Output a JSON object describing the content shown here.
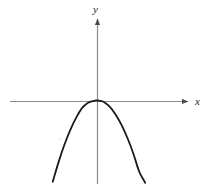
{
  "figure": {
    "kind": "coordinate-plane-parabola",
    "background_color": "#ffffff",
    "width": 211,
    "height": 190
  },
  "axes": {
    "x_label": "x",
    "y_label": "y",
    "axis_color": "#8a8a8a",
    "arrow_color": "#4a4a4a",
    "origin": {
      "x": 97,
      "y": 101
    },
    "x_axis": {
      "start_x": 10,
      "end_x": 190,
      "y": 101,
      "arrow": "right"
    },
    "y_axis": {
      "x": 97,
      "start_y": 17,
      "end_y": 184,
      "arrow": "up"
    },
    "ticks_shown": false,
    "tick_labels": [],
    "gridlines": false
  },
  "chart_data": {
    "type": "line",
    "title": "",
    "subtitle": "",
    "xlabel": "x",
    "ylabel": "y",
    "legend": [],
    "legend_position": "none",
    "grid": false,
    "xlim": [
      -5.8,
      6.2
    ],
    "ylim": [
      -5.6,
      5.6
    ],
    "annotations": [],
    "series": [
      {
        "name": "parabola",
        "curve_color": "#1a1a1a",
        "stroke_width": 1.8,
        "equation_form": "upward parabola tangent to the x-axis at its vertex",
        "vertex": {
          "x": 0.05,
          "y": 0.0
        },
        "opens": "up",
        "x": [
          -3.0,
          -2.6,
          -2.2,
          -1.8,
          -1.4,
          -1.0,
          -0.6,
          -0.2,
          0.05,
          0.4,
          0.8,
          1.2,
          1.6,
          2.0,
          2.4,
          2.8,
          3.2
        ],
        "y": [
          5.45,
          4.1,
          2.92,
          1.92,
          1.1,
          0.46,
          0.13,
          0.01,
          0.0,
          0.08,
          0.4,
          0.92,
          1.62,
          2.5,
          3.55,
          4.78,
          5.52
        ]
      }
    ]
  },
  "artifacts": {
    "speck": {
      "x": 60,
      "y": 139,
      "color": "#f0f0f2"
    }
  }
}
